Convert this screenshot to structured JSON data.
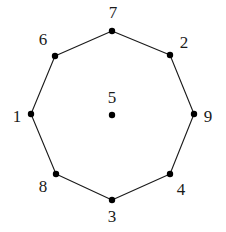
{
  "figure": {
    "background_color": "#ffffff",
    "edge_color": "#1a1a1a",
    "vertex_color": "#000000",
    "label_color": "#1a1a1a",
    "width": 226,
    "height": 232
  },
  "chart_data": {
    "type": "scatter",
    "title": "",
    "xlabel": "",
    "ylabel": "",
    "grid": false,
    "legend": null,
    "xlim": [
      0,
      226
    ],
    "ylim": [
      0,
      232
    ],
    "nodes": [
      {
        "label": "7",
        "x": 112,
        "y": 31,
        "label_x": 113,
        "label_y": 12,
        "ring": "outer"
      },
      {
        "label": "2",
        "x": 170,
        "y": 55,
        "label_x": 184,
        "label_y": 42,
        "ring": "outer"
      },
      {
        "label": "9",
        "x": 194,
        "y": 114,
        "label_x": 208,
        "label_y": 116,
        "ring": "outer"
      },
      {
        "label": "4",
        "x": 170,
        "y": 174,
        "label_x": 181,
        "label_y": 189,
        "ring": "outer"
      },
      {
        "label": "3",
        "x": 112,
        "y": 200,
        "label_x": 112,
        "label_y": 216,
        "ring": "outer"
      },
      {
        "label": "8",
        "x": 56,
        "y": 174,
        "label_x": 43,
        "label_y": 186,
        "ring": "outer"
      },
      {
        "label": "1",
        "x": 31,
        "y": 114,
        "label_x": 17,
        "label_y": 116,
        "ring": "outer"
      },
      {
        "label": "6",
        "x": 55,
        "y": 56,
        "label_x": 43,
        "label_y": 39,
        "ring": "outer"
      },
      {
        "label": "5",
        "x": 112,
        "y": 115,
        "label_x": 112,
        "label_y": 97,
        "ring": "center"
      }
    ],
    "edges": [
      {
        "from": "7",
        "to": "2"
      },
      {
        "from": "2",
        "to": "9"
      },
      {
        "from": "9",
        "to": "4"
      },
      {
        "from": "4",
        "to": "3"
      },
      {
        "from": "3",
        "to": "8"
      },
      {
        "from": "8",
        "to": "1"
      },
      {
        "from": "1",
        "to": "6"
      },
      {
        "from": "6",
        "to": "7"
      }
    ],
    "vertex_radius": 3.2,
    "edge_width": 1.1
  }
}
